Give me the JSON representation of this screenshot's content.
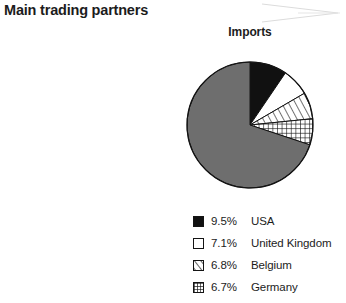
{
  "header": {
    "title": "Main trading partners",
    "chevron_icon": "chevron-right-decorative",
    "chevron_color": "#d8d8d8"
  },
  "chart_data": {
    "type": "pie",
    "title": "Main trading partners",
    "subtitle": "Imports",
    "xlabel": "",
    "ylabel": "",
    "start_angle_deg": 0,
    "direction": "clockwise",
    "categories": [
      "USA",
      "United Kingdom",
      "Belgium",
      "Germany",
      "Others"
    ],
    "values": [
      9.5,
      7.1,
      6.8,
      6.7,
      69.9
    ],
    "value_labels": [
      "9.5%",
      "7.1%",
      "6.8%",
      "6.7%",
      ""
    ],
    "slice_styles": [
      "solid-black",
      "white-outline",
      "diagonal-hatch",
      "crosshatch",
      "solid-gray"
    ],
    "colors": [
      "#111111",
      "#ffffff",
      "#ffffff",
      "#ffffff",
      "#6e6e6e"
    ],
    "stroke_color": "#141414",
    "legend_position": "bottom",
    "legend_visible_entries": 4,
    "grid": false,
    "legend": [
      {
        "swatch": "solid-black",
        "percent": "9.5%",
        "label": "USA"
      },
      {
        "swatch": "white-outline",
        "percent": "7.1%",
        "label": "United Kingdom"
      },
      {
        "swatch": "diagonal-hatch",
        "percent": "6.8%",
        "label": "Belgium"
      },
      {
        "swatch": "crosshatch",
        "percent": "6.7%",
        "label": "Germany"
      }
    ]
  }
}
